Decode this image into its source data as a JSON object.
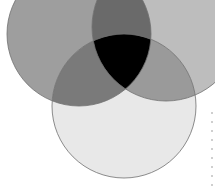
{
  "diagram": {
    "type": "venn",
    "sets": [
      {
        "id": "A",
        "position": "top-left",
        "fill": "#9e9e9e"
      },
      {
        "id": "B",
        "position": "top-right",
        "fill": "#bdbdbd"
      },
      {
        "id": "C",
        "position": "bottom",
        "fill": "#e8e8e8"
      }
    ],
    "intersections": {
      "AB": "#6a6a6a",
      "AC": "#7a7a7a",
      "BC": "#9a9a9a",
      "ABC": "#000000"
    },
    "stroke": "#707070"
  }
}
